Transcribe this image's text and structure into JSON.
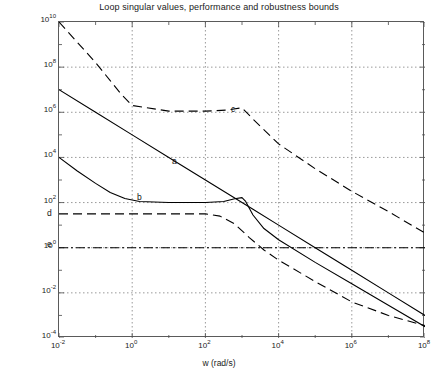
{
  "figure": {
    "title": "Loop singular values, performance and robustness bounds",
    "background_color": "#ffffff",
    "axes_color": "#5a5a5a",
    "grid_color": "#808080",
    "line_color": "#000000"
  },
  "axes": {
    "xlabel": "w (rad/s)",
    "ylabel": "",
    "x_ticks": [
      {
        "label": "10",
        "exp": "-2",
        "value": -2
      },
      {
        "label": "10",
        "exp": "0",
        "value": 0
      },
      {
        "label": "10",
        "exp": "2",
        "value": 2
      },
      {
        "label": "10",
        "exp": "4",
        "value": 4
      },
      {
        "label": "10",
        "exp": "6",
        "value": 6
      },
      {
        "label": "10",
        "exp": "8",
        "value": 8
      }
    ],
    "y_ticks": [
      {
        "label": "10",
        "exp": "10",
        "value": 10
      },
      {
        "label": "10",
        "exp": "8",
        "value": 8
      },
      {
        "label": "10",
        "exp": "6",
        "value": 6
      },
      {
        "label": "10",
        "exp": "4",
        "value": 4
      },
      {
        "label": "10",
        "exp": "2",
        "value": 2
      },
      {
        "label": "10",
        "exp": "0",
        "value": 0
      },
      {
        "label": "10",
        "exp": "-2",
        "value": -2
      },
      {
        "label": "10",
        "exp": "-4",
        "value": -4
      }
    ]
  },
  "annotations": [
    {
      "name": "a",
      "text": "a",
      "left": 172,
      "top": 157
    },
    {
      "name": "b",
      "text": "b",
      "left": 137,
      "top": 193
    },
    {
      "name": "c",
      "text": "c",
      "left": 231,
      "top": 105
    },
    {
      "name": "d",
      "text": "d",
      "left": 47,
      "top": 209
    },
    {
      "name": "e",
      "text": "e",
      "left": 47,
      "top": 240
    }
  ],
  "chart_data": {
    "type": "line",
    "title": "Loop singular values, performance and robustness bounds",
    "xlabel": "w (rad/s)",
    "ylabel": "",
    "xscale": "log",
    "yscale": "log",
    "xlim": [
      -2,
      8
    ],
    "ylim": [
      -4,
      10
    ],
    "grid": true,
    "legend": "none (curves labelled inline: a, b, c, d, e)",
    "series": [
      {
        "name": "a",
        "description": "upper loop singular value - solid line, constant -1 slope roll-off",
        "style": "solid",
        "x": [
          -2,
          -1,
          0,
          1,
          2,
          3,
          3.3,
          4,
          5,
          6,
          7,
          8
        ],
        "y": [
          7.0,
          6.0,
          5.0,
          4.0,
          3.0,
          2.0,
          1.7,
          1.0,
          0.0,
          -1.0,
          -2.0,
          -3.0
        ]
      },
      {
        "name": "b",
        "description": "lower loop singular value - solid line, flattens near 1e2 then rolls off steeply",
        "style": "solid",
        "x": [
          -2,
          -1.5,
          -1,
          -0.6,
          -0.2,
          0.2,
          1,
          2,
          2.5,
          2.8,
          3.0,
          3.1,
          3.3,
          3.6,
          4,
          5,
          6,
          7,
          8
        ],
        "y": [
          4.0,
          3.4,
          2.85,
          2.45,
          2.18,
          2.05,
          2.0,
          2.0,
          2.05,
          2.17,
          2.22,
          2.05,
          1.45,
          0.85,
          0.35,
          -0.65,
          -1.6,
          -2.55,
          -3.5
        ]
      },
      {
        "name": "c",
        "description": "robustness bound - dashed, starts 1e10, flat plateau near 1e6, then rolls off to ~1e0",
        "style": "dashed",
        "x": [
          -2,
          -1.5,
          -1,
          -0.6,
          -0.3,
          0,
          1,
          2,
          2.6,
          3.0,
          3.3,
          4,
          5,
          6,
          7,
          8
        ],
        "y": [
          10.0,
          9.1,
          8.2,
          7.4,
          6.8,
          6.3,
          6.05,
          6.05,
          6.1,
          6.2,
          5.7,
          4.6,
          3.5,
          2.5,
          1.6,
          0.65
        ]
      },
      {
        "name": "d",
        "description": "performance bound - dashed, flat near 3e1 then falls off",
        "style": "dashed",
        "x": [
          -2,
          -1,
          0,
          1,
          2,
          2.4,
          2.8,
          3.2,
          3.6,
          4,
          5,
          6,
          7,
          8
        ],
        "y": [
          1.5,
          1.5,
          1.5,
          1.5,
          1.5,
          1.4,
          1.05,
          0.45,
          -0.1,
          -0.55,
          -1.5,
          -2.4,
          -3.0,
          -3.45
        ]
      },
      {
        "name": "e",
        "description": "unity gain reference line - dash-dot, constant at 1",
        "style": "dashdot",
        "x": [
          -2,
          8
        ],
        "y": [
          0.0,
          0.0
        ]
      }
    ]
  }
}
